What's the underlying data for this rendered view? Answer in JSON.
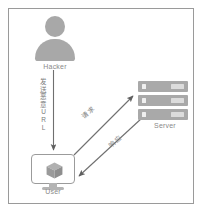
{
  "diagram": {
    "type": "network-attack-flow",
    "colors": {
      "frame_border": "#9a9a9a",
      "figure_gray": "#a8a8a8",
      "server_gray": "#a9a9a9",
      "outline_gray": "#9b9b9b",
      "arrow_gray": "#6f6f6f",
      "label_gray": "#8a8a8a",
      "background": "#ffffff"
    },
    "nodes": {
      "hacker": {
        "label": "Hacker",
        "icon": "user-avatar-icon"
      },
      "user": {
        "label": "User",
        "icon": "monitor-cube-icon"
      },
      "server": {
        "label": "Server",
        "icon": "server-stack-icon",
        "unit_count": 3
      }
    },
    "edges": {
      "hacker_to_user": {
        "label_chars": [
          "发",
          "送",
          "恶",
          "意",
          "U",
          "R",
          "L"
        ],
        "label_text": "发送恶意URL",
        "direction": "down",
        "orientation": "vertical"
      },
      "user_to_server": {
        "label": "请求",
        "direction": "up-right"
      },
      "server_to_user": {
        "label": "响应",
        "direction": "down-left"
      }
    }
  }
}
